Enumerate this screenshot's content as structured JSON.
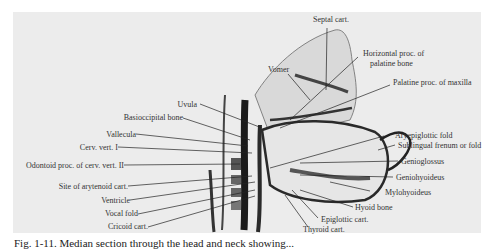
{
  "figure": {
    "type": "anatomical illustration (median sagittal section of head and neck)",
    "labels_left": [
      {
        "id": "uvula",
        "text": "Uvula"
      },
      {
        "id": "basioccipital",
        "text": "Basioccipital bone"
      },
      {
        "id": "vallecula",
        "text": "Vallecula"
      },
      {
        "id": "cerv1",
        "text": "Cerv. vert. I"
      },
      {
        "id": "odontoid",
        "text": "Odontoid proc. of cerv. vert. II"
      },
      {
        "id": "arytenoid",
        "text": "Site of arytenoid cart."
      },
      {
        "id": "ventricle",
        "text": "Ventricle"
      },
      {
        "id": "vocal",
        "text": "Vocal fold"
      },
      {
        "id": "cricoid",
        "text": "Cricoid cart."
      }
    ],
    "labels_top": [
      {
        "id": "septal",
        "text": "Septal cart."
      },
      {
        "id": "vomer",
        "text": "Vomer"
      },
      {
        "id": "horizontal1",
        "text": "Horizontal proc. of"
      },
      {
        "id": "horizontal2",
        "text": "palatine bone"
      },
      {
        "id": "palatine",
        "text": "Palatine proc. of maxilla"
      }
    ],
    "labels_right": [
      {
        "id": "aryepiglottic",
        "text": "Aryepiglottic fold"
      },
      {
        "id": "sublingual",
        "text": "Sublingual frenum or fold"
      },
      {
        "id": "genioglossus",
        "text": "Genioglossus"
      },
      {
        "id": "geniohyoideus",
        "text": "Geniohyoideus"
      },
      {
        "id": "mylohyoideus",
        "text": "Mylohyoideus"
      },
      {
        "id": "hyoid",
        "text": "Hyoid bone"
      },
      {
        "id": "epiglottic",
        "text": "Epiglottic cart."
      },
      {
        "id": "thyroid",
        "text": "Thyroid cart."
      }
    ]
  },
  "caption": {
    "text": "Fig. 1-11. Median section through the head and neck showing..."
  }
}
